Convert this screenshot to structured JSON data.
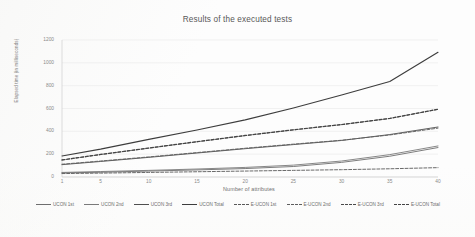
{
  "chart_data": {
    "type": "line",
    "title": "Results of the executed tests",
    "xlabel": "Number of attributes",
    "ylabel": "Elapsed time (in milliseconds)",
    "xlim": [
      1,
      40
    ],
    "ylim": [
      0,
      1200
    ],
    "grid": true,
    "legend_position": "bottom",
    "x_ticks": [
      "1",
      "5",
      "10",
      "15",
      "20",
      "25",
      "30",
      "35",
      "40"
    ],
    "y_ticks": [
      "0",
      "200",
      "400",
      "600",
      "800",
      "1000",
      "1200"
    ],
    "x": [
      1,
      5,
      10,
      15,
      20,
      25,
      30,
      35,
      40
    ],
    "series": [
      {
        "name": "UCON 1st",
        "style": "solid",
        "color": "#6e6e6e",
        "values": [
          36,
          42,
          52,
          62,
          74,
          92,
          128,
          182,
          258
        ]
      },
      {
        "name": "UCON 2nd",
        "style": "solid",
        "color": "#7a7a7a",
        "values": [
          40,
          48,
          58,
          70,
          84,
          104,
          140,
          196,
          272
        ]
      },
      {
        "name": "UCON 3rd",
        "style": "solid",
        "color": "#4f4f4f",
        "values": [
          108,
          136,
          172,
          210,
          248,
          284,
          320,
          372,
          438
        ]
      },
      {
        "name": "UCON Total",
        "style": "solid",
        "color": "#3d3d3d",
        "values": [
          184,
          244,
          330,
          412,
          500,
          604,
          718,
          836,
          1092
        ]
      },
      {
        "name": "E-UCON 1st",
        "style": "dashed",
        "color": "#595959",
        "values": [
          30,
          34,
          40,
          46,
          52,
          58,
          64,
          72,
          82
        ]
      },
      {
        "name": "E-UCON 2nd",
        "style": "dashed",
        "color": "#5e5e5e",
        "values": [
          112,
          140,
          176,
          214,
          252,
          288,
          322,
          368,
          428
        ]
      },
      {
        "name": "E-UCON 3rd",
        "style": "dashed",
        "color": "#4a4a4a",
        "values": [
          148,
          196,
          252,
          308,
          362,
          412,
          458,
          512,
          592
        ]
      },
      {
        "name": "E-UCON Total",
        "style": "dashed",
        "color": "#444444",
        "values": [
          150,
          198,
          254,
          310,
          364,
          414,
          460,
          514,
          594
        ]
      }
    ]
  }
}
